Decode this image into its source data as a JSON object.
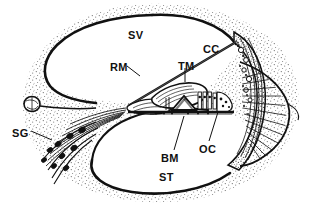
{
  "figure": {
    "background_color": "#ffffff",
    "ink_color": "#111111",
    "stipple_color": "#6b6b6b",
    "width": 314,
    "height": 211
  },
  "labels": [
    {
      "id": "sv",
      "text": "SV",
      "meaning": "scala vestibuli",
      "x": 128,
      "y": 30,
      "leader": false
    },
    {
      "id": "cc",
      "text": "CC",
      "meaning": "cochlear duct / canal",
      "x": 203,
      "y": 44,
      "leader": false
    },
    {
      "id": "rm",
      "text": "RM",
      "meaning": "Reissner's membrane",
      "x": 110,
      "y": 62,
      "leader": true
    },
    {
      "id": "tm",
      "text": "TM",
      "meaning": "tectorial membrane",
      "x": 178,
      "y": 61,
      "leader": true
    },
    {
      "id": "sg",
      "text": "SG",
      "meaning": "spiral ganglion",
      "x": 12,
      "y": 128,
      "leader": true
    },
    {
      "id": "oc",
      "text": "OC",
      "meaning": "organ of Corti",
      "x": 199,
      "y": 144,
      "leader": true
    },
    {
      "id": "bm",
      "text": "BM",
      "meaning": "basilar membrane",
      "x": 161,
      "y": 153,
      "leader": true
    },
    {
      "id": "st",
      "text": "ST",
      "meaning": "scala tympani",
      "x": 159,
      "y": 172,
      "leader": false
    }
  ],
  "structures": {
    "scala_vestibuli": "SV",
    "cochlear_canal": "CC",
    "scala_tympani": "ST",
    "reissners_membrane": "RM",
    "tectorial_membrane": "TM",
    "basilar_membrane": "BM",
    "organ_of_corti": "OC",
    "spiral_ganglion": "SG"
  }
}
